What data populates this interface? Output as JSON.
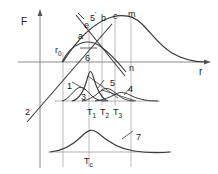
{
  "figure": {
    "axes": {
      "y_label": "F",
      "x_label": "r"
    },
    "colors": {
      "curve": "#3a3a3a",
      "guide": "#9a9a9a",
      "axis": "#8a8a8a",
      "text": "#1a1a1a",
      "background": "#ffffff"
    },
    "point_labels": [
      {
        "id": "r0",
        "text": "r",
        "sub": "0",
        "x": 55,
        "y": 46
      },
      {
        "id": "a",
        "text": "a",
        "sub": "",
        "x": 78,
        "y": 32
      },
      {
        "id": "e",
        "text": "e",
        "sub": "",
        "x": 84,
        "y": 21
      },
      {
        "id": "fivep",
        "text": "5",
        "sup": "'",
        "x": 90,
        "y": 11
      },
      {
        "id": "b",
        "text": "b",
        "sub": "",
        "x": 101,
        "y": 14
      },
      {
        "id": "c",
        "text": "c",
        "sub": "",
        "x": 113,
        "y": 12
      },
      {
        "id": "m",
        "text": "m",
        "sub": "",
        "x": 128,
        "y": 10
      },
      {
        "id": "n",
        "text": "n",
        "sub": "",
        "x": 129,
        "y": 64
      },
      {
        "id": "two",
        "text": "2",
        "sub": "",
        "x": 25,
        "y": 108
      },
      {
        "id": "six",
        "text": "6",
        "sub": "",
        "x": 85,
        "y": 54
      },
      {
        "id": "one",
        "text": "1",
        "sub": "",
        "x": 67,
        "y": 82
      },
      {
        "id": "three",
        "text": "3",
        "sub": "",
        "x": 81,
        "y": 93
      },
      {
        "id": "five",
        "text": "5",
        "sub": "",
        "x": 110,
        "y": 79
      },
      {
        "id": "four",
        "text": "4",
        "sub": "",
        "x": 128,
        "y": 85
      },
      {
        "id": "seven",
        "text": "7",
        "sub": "",
        "x": 136,
        "y": 133
      }
    ],
    "temperature_ticks": [
      {
        "id": "T1",
        "text": "T",
        "sub": "1",
        "x": 87,
        "y": 108
      },
      {
        "id": "T2",
        "text": "T",
        "sub": "2",
        "x": 100,
        "y": 108
      },
      {
        "id": "T3",
        "text": "T",
        "sub": "3",
        "x": 113,
        "y": 108
      },
      {
        "id": "Tc",
        "text": "T",
        "sub": "c",
        "x": 90,
        "y": 157
      }
    ],
    "curves": [
      {
        "id": "curve-2",
        "label": "2",
        "description": "rising straight line from lower-left through r0"
      },
      {
        "id": "curve-6",
        "label": "6",
        "description": "low broad arch peaking near r0 region"
      },
      {
        "id": "curve-5p",
        "label": "5'",
        "description": "descending straight line crossing point a"
      },
      {
        "id": "curve-m",
        "label": "m",
        "description": "large hump peaking at m and decaying to the right"
      },
      {
        "id": "curve-1",
        "label": "1",
        "description": "narrow tall peak near T1"
      },
      {
        "id": "curve-3",
        "label": "3",
        "description": "small low peak left of T1"
      },
      {
        "id": "curve-5",
        "label": "5",
        "description": "medium peak near T2"
      },
      {
        "id": "curve-4",
        "label": "4",
        "description": "broad low peak near T3"
      },
      {
        "id": "curve-7",
        "label": "7",
        "description": "broad bell curve centered at Tc in lower panel"
      }
    ]
  }
}
